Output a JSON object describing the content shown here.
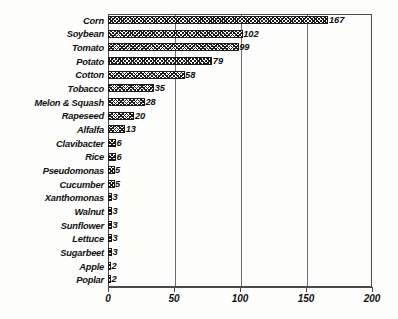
{
  "chart_data": {
    "type": "bar",
    "orientation": "horizontal",
    "title": "",
    "subtitle": "",
    "xlabel": "",
    "ylabel": "",
    "xlim": [
      0,
      200
    ],
    "xticks": [
      "0",
      "50",
      "100",
      "150",
      "200"
    ],
    "xtick_values": [
      0,
      50,
      100,
      150,
      200
    ],
    "grid": "vertical",
    "legend": "none",
    "categories": [
      "Corn",
      "Soybean",
      "Tomato",
      "Potato",
      "Cotton",
      "Tobacco",
      "Melon & Squash",
      "Rapeseed",
      "Alfalfa",
      "Clavibacter",
      "Rice",
      "Pseudomonas",
      "Cucumber",
      "Xanthomonas",
      "Walnut",
      "Sunflower",
      "Lettuce",
      "Sugarbeet",
      "Apple",
      "Poplar"
    ],
    "values": [
      167,
      102,
      99,
      79,
      58,
      35,
      28,
      20,
      13,
      6,
      6,
      5,
      5,
      3,
      3,
      3,
      3,
      3,
      2,
      2
    ],
    "value_labels": [
      "167",
      "102",
      "99",
      "79",
      "58",
      "35",
      "28",
      "20",
      "13",
      "6",
      "6",
      "5",
      "5",
      "3",
      "3",
      "3",
      "3",
      "3",
      "2",
      "2"
    ],
    "bar_fill": "#1c1c1c",
    "bar_edge": "#1a1a1a",
    "bar_pattern": "cross-hatch",
    "axis_color": "#4a4a4a",
    "grid_color": "#6e6e6e",
    "background": "#fdfdfc"
  }
}
